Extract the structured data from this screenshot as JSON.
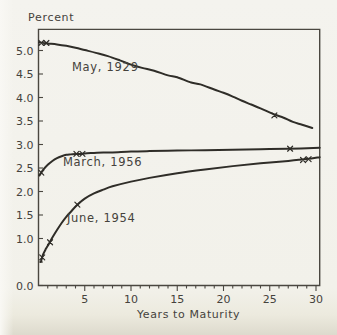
{
  "colors": {
    "background": "#f2f1ea",
    "paper_edge_shadow": "#dddacd",
    "ink": "#2f2d28",
    "axis": "#4a4740",
    "text": "#45423c"
  },
  "chart_data": {
    "type": "line",
    "title": "",
    "ylabel": "Percent",
    "xlabel": "Years to Maturity",
    "xlim": [
      0,
      30.4
    ],
    "ylim": [
      0,
      5.45
    ],
    "grid": false,
    "legend": "inline-labels",
    "x_ticks": {
      "minor_step": 1,
      "major": [
        {
          "v": 5,
          "label": "5"
        },
        {
          "v": 10,
          "label": "10"
        },
        {
          "v": 15,
          "label": "15"
        },
        {
          "v": 20,
          "label": "20"
        },
        {
          "v": 25,
          "label": "25"
        },
        {
          "v": 30,
          "label": "30"
        }
      ]
    },
    "y_ticks": [
      {
        "v": 0.0,
        "label": "0.0"
      },
      {
        "v": 0.5,
        "label": ""
      },
      {
        "v": 1.0,
        "label": "1.0"
      },
      {
        "v": 1.5,
        "label": "1.5"
      },
      {
        "v": 2.0,
        "label": "2.0"
      },
      {
        "v": 2.5,
        "label": "2.5"
      },
      {
        "v": 3.0,
        "label": "3.0"
      },
      {
        "v": 3.5,
        "label": "3.5"
      },
      {
        "v": 4.0,
        "label": "4.0"
      },
      {
        "v": 4.5,
        "label": "4.5"
      },
      {
        "v": 5.0,
        "label": "5.0"
      }
    ],
    "series": [
      {
        "id": "may-1929",
        "name": "May, 1929",
        "points": [
          [
            0.05,
            5.17
          ],
          [
            1,
            5.15
          ],
          [
            2,
            5.13
          ],
          [
            3,
            5.1
          ],
          [
            4,
            5.06
          ],
          [
            5,
            5.01
          ],
          [
            6.2,
            4.95
          ],
          [
            7.5,
            4.88
          ],
          [
            8.8,
            4.79
          ],
          [
            10,
            4.7
          ],
          [
            11.2,
            4.63
          ],
          [
            12.5,
            4.57
          ],
          [
            14,
            4.47
          ],
          [
            15,
            4.43
          ],
          [
            16.5,
            4.32
          ],
          [
            17.5,
            4.28
          ],
          [
            19,
            4.17
          ],
          [
            20,
            4.1
          ],
          [
            21,
            4.02
          ],
          [
            22,
            3.93
          ],
          [
            23,
            3.85
          ],
          [
            24,
            3.77
          ],
          [
            25.5,
            3.64
          ],
          [
            26.5,
            3.57
          ],
          [
            27.5,
            3.48
          ],
          [
            28.5,
            3.42
          ],
          [
            29.6,
            3.35
          ]
        ],
        "markers": [
          [
            0.3,
            5.16
          ],
          [
            0.85,
            5.16
          ],
          [
            25.5,
            3.62
          ]
        ]
      },
      {
        "id": "march-1956",
        "name": "March, 1956",
        "points": [
          [
            0.1,
            2.34
          ],
          [
            0.5,
            2.46
          ],
          [
            1,
            2.57
          ],
          [
            1.5,
            2.65
          ],
          [
            2,
            2.71
          ],
          [
            2.5,
            2.75
          ],
          [
            3,
            2.78
          ],
          [
            3.5,
            2.79
          ],
          [
            4,
            2.8
          ],
          [
            4.5,
            2.8
          ],
          [
            5,
            2.81
          ],
          [
            6,
            2.82
          ],
          [
            7,
            2.83
          ],
          [
            8,
            2.83
          ],
          [
            10,
            2.85
          ],
          [
            12,
            2.86
          ],
          [
            15,
            2.87
          ],
          [
            18,
            2.88
          ],
          [
            21,
            2.89
          ],
          [
            24,
            2.9
          ],
          [
            27,
            2.91
          ],
          [
            30.4,
            2.93
          ]
        ],
        "markers": [
          [
            0.3,
            2.4
          ],
          [
            4.1,
            2.8
          ],
          [
            4.75,
            2.8
          ],
          [
            27.2,
            2.91
          ]
        ]
      },
      {
        "id": "june-1954",
        "name": "June, 1954",
        "points": [
          [
            0.25,
            0.5
          ],
          [
            0.5,
            0.66
          ],
          [
            0.8,
            0.78
          ],
          [
            1.1,
            0.88
          ],
          [
            1.5,
            1.02
          ],
          [
            2,
            1.18
          ],
          [
            2.5,
            1.33
          ],
          [
            3,
            1.46
          ],
          [
            3.5,
            1.57
          ],
          [
            4.2,
            1.72
          ],
          [
            5,
            1.85
          ],
          [
            6,
            1.96
          ],
          [
            7,
            2.04
          ],
          [
            8,
            2.11
          ],
          [
            10,
            2.21
          ],
          [
            12,
            2.29
          ],
          [
            15,
            2.39
          ],
          [
            18,
            2.47
          ],
          [
            21,
            2.54
          ],
          [
            24,
            2.6
          ],
          [
            27,
            2.65
          ],
          [
            29,
            2.69
          ],
          [
            30.4,
            2.73
          ]
        ],
        "markers": [
          [
            0.4,
            0.6
          ],
          [
            1.25,
            0.92
          ],
          [
            4.2,
            1.72
          ],
          [
            28.6,
            2.67
          ],
          [
            29.2,
            2.69
          ]
        ]
      }
    ]
  }
}
